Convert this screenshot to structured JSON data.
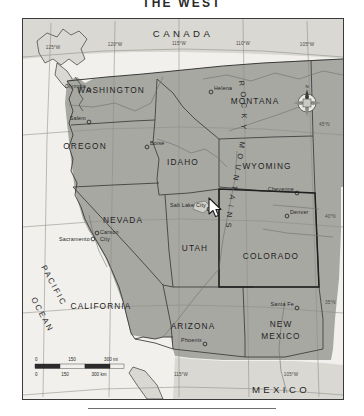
{
  "page": {
    "title": "THE WEST"
  },
  "map": {
    "countries": [
      {
        "name": "CANADA",
        "x": 160,
        "y": 16
      },
      {
        "name": "MEXICO",
        "x": 258,
        "y": 372
      }
    ],
    "ocean": {
      "name": "PACIFIC OCEAN",
      "lines": [
        "PACIFIC",
        "OCEAN"
      ]
    },
    "mountain_range": {
      "name": "ROCKY MOUNTAINS",
      "letters": "ROCKY MOUNTAINS"
    },
    "states": [
      {
        "name": "WASHINGTON",
        "x": 88,
        "y": 74
      },
      {
        "name": "OREGON",
        "x": 62,
        "y": 128
      },
      {
        "name": "MONTANA",
        "x": 222,
        "y": 83
      },
      {
        "name": "IDAHO",
        "x": 158,
        "y": 142
      },
      {
        "name": "WYOMING",
        "x": 240,
        "y": 148
      },
      {
        "name": "NEVADA",
        "x": 98,
        "y": 202
      },
      {
        "name": "UTAH",
        "x": 172,
        "y": 229
      },
      {
        "name": "COLORADO",
        "x": 260,
        "y": 237
      },
      {
        "name": "CALIFORNIA",
        "x": 74,
        "y": 288
      },
      {
        "name": "ARIZONA",
        "x": 160,
        "y": 308
      },
      {
        "name": "NEW MEXICO",
        "x": 258,
        "y": 308,
        "lines": [
          "NEW",
          "MEXICO"
        ]
      }
    ],
    "cities": [
      {
        "name": "Olympia",
        "x": 52,
        "y": 70,
        "dot_x": 66,
        "dot_y": 72
      },
      {
        "name": "Salem",
        "x": 52,
        "y": 101,
        "dot_x": 66,
        "dot_y": 103
      },
      {
        "name": "Helena",
        "x": 192,
        "y": 73,
        "dot_x": 190,
        "dot_y": 75
      },
      {
        "name": "Boise",
        "x": 128,
        "y": 127,
        "dot_x": 125,
        "dot_y": 129
      },
      {
        "name": "Sacramento",
        "x": 30,
        "y": 219,
        "dot_x": 68,
        "dot_y": 221
      },
      {
        "name": "Carson City",
        "x": 66,
        "y": 219,
        "dot_x": 63,
        "dot_y": 216,
        "lines": [
          "Carson",
          "City"
        ]
      },
      {
        "name": "Salt Lake City",
        "x": 140,
        "y": 194,
        "dot_x": 183,
        "dot_y": 192
      },
      {
        "name": "Cheyenne",
        "x": 248,
        "y": 173,
        "dot_x": 268,
        "dot_y": 175
      },
      {
        "name": "Denver",
        "x": 268,
        "y": 196,
        "dot_x": 264,
        "dot_y": 198
      },
      {
        "name": "Santa Fe",
        "x": 246,
        "y": 285,
        "dot_x": 272,
        "dot_y": 288
      },
      {
        "name": "Phoenix",
        "x": 148,
        "y": 322,
        "dot_x": 178,
        "dot_y": 325
      }
    ],
    "graticule": {
      "longitude_labels": [
        {
          "label": "125°W",
          "x": 26,
          "y": 29
        },
        {
          "label": "120°W",
          "x": 84,
          "y": 26
        },
        {
          "label": "115°W",
          "x": 148,
          "y": 25
        },
        {
          "label": "110°W",
          "x": 212,
          "y": 25
        },
        {
          "label": "105°W",
          "x": 276,
          "y": 26
        },
        {
          "label": "115°W",
          "x": 160,
          "y": 355
        },
        {
          "label": "105°W",
          "x": 266,
          "y": 355
        }
      ],
      "latitude_labels": [
        {
          "label": "45°N",
          "x": 294,
          "y": 105
        },
        {
          "label": "40°N",
          "x": 300,
          "y": 197
        },
        {
          "label": "35°N",
          "x": 300,
          "y": 283
        }
      ]
    },
    "compass": {
      "label": "N"
    },
    "scale_bar": {
      "miles": {
        "unit": "mi",
        "ticks": [
          "0",
          "150",
          "300"
        ]
      },
      "kilometers": {
        "unit": "km",
        "ticks": [
          "0",
          "150",
          "300"
        ]
      },
      "miles_label": "300 mi",
      "km_label": "300 km"
    },
    "colors": {
      "land_us": "#a8a8a3",
      "land_other": "#d9d8d2",
      "water": "#f1f0ec",
      "border": "#3a3a3a"
    }
  }
}
